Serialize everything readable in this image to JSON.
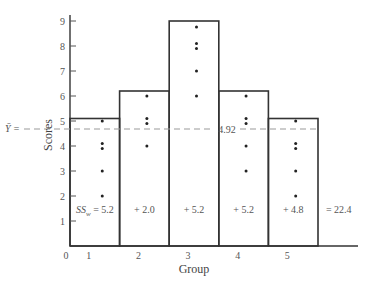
{
  "chart_data": {
    "type": "bar",
    "title": "",
    "xlabel": "Group",
    "ylabel": "Scores",
    "ylim": [
      0,
      9
    ],
    "yticks": [
      1,
      2,
      3,
      4,
      5,
      6,
      7,
      8,
      9
    ],
    "xticks": [
      "0",
      "1",
      "2",
      "3",
      "4",
      "5"
    ],
    "categories": [
      "1",
      "2",
      "3",
      "4",
      "5"
    ],
    "bar_heights": [
      5.1,
      6.2,
      9.0,
      6.2,
      5.1
    ],
    "points": [
      [
        5,
        4,
        4,
        3,
        2
      ],
      [
        6,
        5,
        5,
        4
      ],
      [
        9,
        8,
        8,
        7,
        6
      ],
      [
        6,
        5,
        5,
        4,
        3
      ],
      [
        5,
        4,
        4,
        3,
        2
      ]
    ],
    "grand_mean": 4.92,
    "grand_mean_label": "Ȳ = ",
    "grand_mean_value_label": "4.92",
    "ss_annotations": [
      "SSw = 5.2",
      "+ 2.0",
      "+ 5.2",
      "+ 5.2",
      "+ 4.8",
      "= 22.4"
    ],
    "ss_prefix": "SS",
    "ss_subscript": "w",
    "ss_first_value": " = 5.2",
    "grid": false,
    "legend": null
  }
}
